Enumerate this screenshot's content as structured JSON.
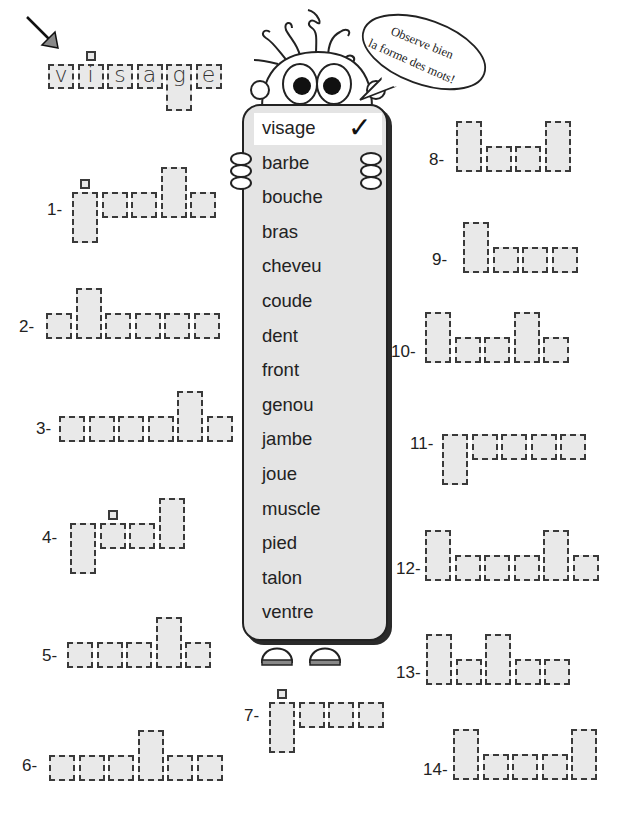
{
  "speech_bubble": {
    "line1": "Observe bien",
    "line2": "la forme des mots!"
  },
  "example": {
    "word": "visage",
    "letters": [
      "v",
      "i",
      "s",
      "a",
      "g",
      "e"
    ]
  },
  "word_list": {
    "items": [
      "visage",
      "barbe",
      "bouche",
      "bras",
      "cheveu",
      "coude",
      "dent",
      "front",
      "genou",
      "jambe",
      "joue",
      "muscle",
      "pied",
      "talon",
      "ventre"
    ],
    "checked_item": "visage",
    "check_mark": "✓"
  },
  "exercises": [
    {
      "label": "1-",
      "shape": [
        "jd",
        "s",
        "s",
        "t",
        "s"
      ]
    },
    {
      "label": "2-",
      "shape": [
        "s",
        "t",
        "s",
        "s",
        "s",
        "s"
      ]
    },
    {
      "label": "3-",
      "shape": [
        "s",
        "s",
        "s",
        "s",
        "t",
        "s"
      ]
    },
    {
      "label": "4-",
      "shape": [
        "d",
        "i",
        "s",
        "t"
      ]
    },
    {
      "label": "5-",
      "shape": [
        "s",
        "s",
        "s",
        "t",
        "s"
      ]
    },
    {
      "label": "6-",
      "shape": [
        "s",
        "s",
        "s",
        "t",
        "s",
        "s"
      ]
    },
    {
      "label": "7-",
      "shape": [
        "jd",
        "s",
        "s",
        "s"
      ]
    },
    {
      "label": "8-",
      "shape": [
        "t",
        "s",
        "s",
        "t"
      ]
    },
    {
      "label": "9-",
      "shape": [
        "t",
        "s",
        "s",
        "s"
      ]
    },
    {
      "label": "10-",
      "shape": [
        "t",
        "s",
        "s",
        "t",
        "s"
      ]
    },
    {
      "label": "11-",
      "shape": [
        "d",
        "s",
        "s",
        "s",
        "s"
      ]
    },
    {
      "label": "12-",
      "shape": [
        "t",
        "s",
        "s",
        "s",
        "t",
        "s"
      ]
    },
    {
      "label": "13-",
      "shape": [
        "t",
        "s",
        "t",
        "s",
        "s"
      ]
    },
    {
      "label": "14-",
      "shape": [
        "t",
        "s",
        "s",
        "s",
        "t"
      ]
    }
  ]
}
